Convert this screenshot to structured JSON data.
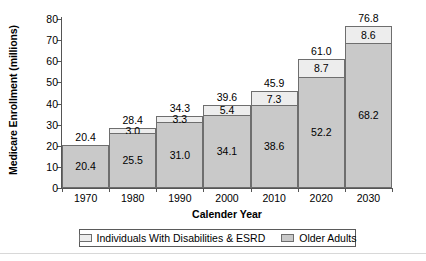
{
  "chart_data": {
    "type": "bar",
    "stacked": true,
    "title": "",
    "xlabel": "Calender Year",
    "ylabel": "Medicare Enrollment (millions)",
    "categories": [
      "1970",
      "1980",
      "1990",
      "2000",
      "2010",
      "2020",
      "2030"
    ],
    "series": [
      {
        "name": "Older Adults",
        "color": "#c9c9c9",
        "values": [
          20.4,
          25.5,
          31.0,
          34.1,
          38.6,
          52.2,
          68.2
        ],
        "labels": [
          "20.4",
          "25.5",
          "31.0",
          "34.1",
          "38.6",
          "52.2",
          "68.2"
        ]
      },
      {
        "name": "Individuals With Disabilities & ESRD",
        "color": "#ededed",
        "values": [
          0,
          3.0,
          3.3,
          5.4,
          7.3,
          8.7,
          8.6
        ],
        "labels": [
          "",
          "3.0",
          "3.3",
          "5.4",
          "7.3",
          "8.7",
          "8.6"
        ]
      }
    ],
    "totals": [
      20.4,
      28.4,
      34.3,
      39.6,
      45.9,
      61.0,
      76.8
    ],
    "total_labels": [
      "20.4",
      "28.4",
      "34.3",
      "39.6",
      "45.9",
      "61.0",
      "76.8"
    ],
    "ylim": [
      0,
      80
    ],
    "yticks": [
      0,
      10,
      20,
      30,
      40,
      50,
      60,
      70,
      80
    ],
    "ytick_labels": [
      "0",
      "10",
      "20",
      "30",
      "40",
      "50",
      "60",
      "70",
      "80"
    ],
    "grid": false,
    "legend_position": "bottom"
  },
  "legend": {
    "items": [
      {
        "label": "Individuals With Disabilities & ESRD",
        "swatch": "light"
      },
      {
        "label": "Older Adults",
        "swatch": "dark"
      }
    ]
  }
}
